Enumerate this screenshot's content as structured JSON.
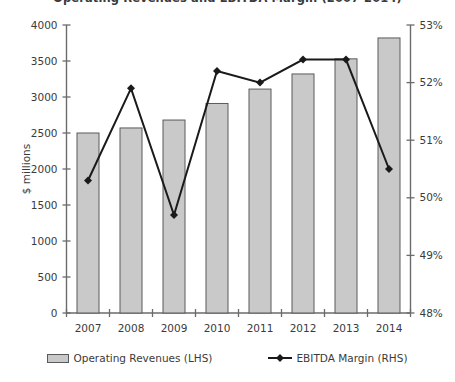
{
  "chart_data": {
    "type": "bar",
    "title": "Operating Revenues and EBITDA Margin (2007-2014)",
    "xlabel": "",
    "ylabel": "$ millions",
    "y2label": "",
    "categories": [
      "2007",
      "2008",
      "2009",
      "2010",
      "2011",
      "2012",
      "2013",
      "2014"
    ],
    "ylim": [
      0,
      4000
    ],
    "y2lim": [
      48,
      53
    ],
    "yticks": [
      0,
      500,
      1000,
      1500,
      2000,
      2500,
      3000,
      3500,
      4000
    ],
    "ytick_labels": [
      "0",
      "500",
      "1000",
      "1500",
      "2000",
      "2500",
      "3000",
      "3500",
      "4000"
    ],
    "y2ticks": [
      48,
      49,
      50,
      51,
      52,
      53
    ],
    "y2tick_labels": [
      "48%",
      "49%",
      "50%",
      "51%",
      "52%",
      "53%"
    ],
    "grid": false,
    "legend_position": "bottom",
    "series": [
      {
        "name": "Operating Revenues (LHS)",
        "type": "bar",
        "axis": "left",
        "unit": "$ millions",
        "color": "#c9c9c9",
        "edge_color": "#5a5a5a",
        "values": [
          2500,
          2570,
          2680,
          2910,
          3110,
          3320,
          3530,
          3820
        ]
      },
      {
        "name": "EBITDA Margin (RHS)",
        "type": "line",
        "axis": "right",
        "unit": "%",
        "color": "#1a1a1a",
        "marker": "diamond",
        "values": [
          50.3,
          51.9,
          49.7,
          52.2,
          52.0,
          52.4,
          52.4,
          50.5
        ]
      }
    ]
  },
  "legend": {
    "items": [
      {
        "label": "Operating Revenues (LHS)",
        "marker": "bar-swatch"
      },
      {
        "label": "EBITDA Margin (RHS)",
        "marker": "line-diamond-swatch"
      }
    ]
  },
  "axes": {
    "left_title": "$ millions",
    "left_tick_labels": [
      "4000",
      "3500",
      "3000",
      "2500",
      "2000",
      "1500",
      "1000",
      "500",
      "0"
    ],
    "right_tick_labels": [
      "53%",
      "52%",
      "51%",
      "50%",
      "49%",
      "48%"
    ],
    "x_tick_labels": [
      "2007",
      "2008",
      "2009",
      "2010",
      "2011",
      "2012",
      "2013",
      "2014"
    ]
  },
  "colors": {
    "bar_fill": "#c9c9c9",
    "bar_edge": "#5a5a5a",
    "line": "#1a1a1a",
    "axis": "#6b6b6b",
    "text": "#3b3b3b",
    "background": "#ffffff"
  }
}
